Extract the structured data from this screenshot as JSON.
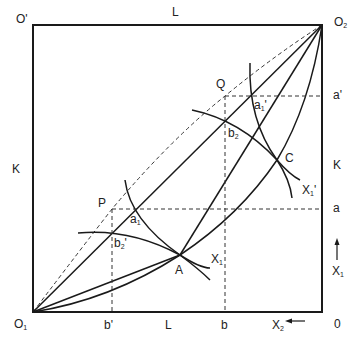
{
  "diagram": {
    "type": "edgeworth-box",
    "corners": {
      "top_left": "O'",
      "top_right": "O",
      "top_right_sub": "2",
      "bottom_left": "O",
      "bottom_left_sub": "1",
      "bottom_right": "0"
    },
    "axis_labels": {
      "top": "L",
      "bottom_L": "L",
      "left": "K",
      "right": "K",
      "x2": "X",
      "x2_sub": "2",
      "x1_axis": "X",
      "x1_axis_sub": "1"
    },
    "points": {
      "P": "P",
      "Q": "Q",
      "A": "A",
      "C": "C",
      "a1": "a",
      "a1_sub": "1",
      "a1p": "a",
      "a1p_sub": "1",
      "b2": "b",
      "b2_sub": "2",
      "b2p": "b",
      "b2p_sub": "2"
    },
    "ticks": {
      "b_prime": "b'",
      "b": "b",
      "a": "a",
      "a_prime": "a'"
    },
    "curves": {
      "x1": "X",
      "x1_sub": "1",
      "x1p": "X",
      "x1p_sub": "1",
      "x1p_prime": "'"
    },
    "colors": {
      "line": "#1a1a1a",
      "dashed": "#333333",
      "background": "#ffffff"
    }
  }
}
